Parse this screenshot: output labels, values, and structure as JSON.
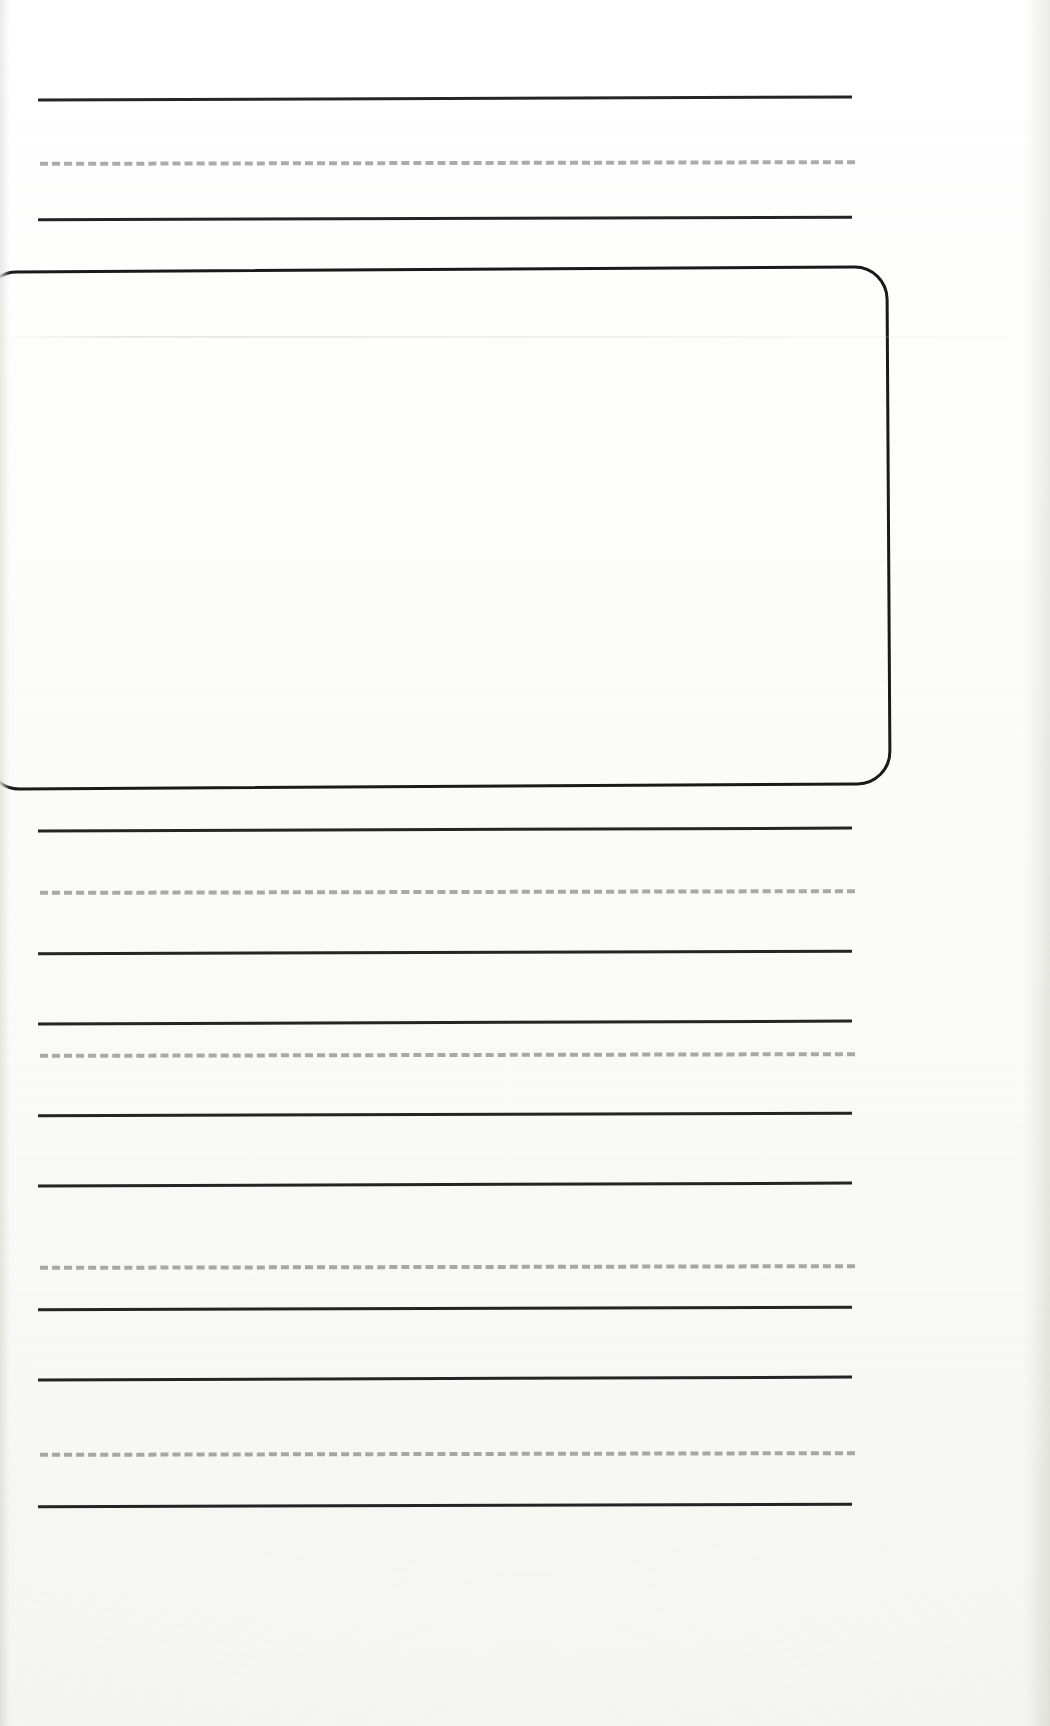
{
  "document": {
    "kind": "handwriting-practice-worksheet",
    "title": "",
    "page_width": 1050,
    "page_height": 1726,
    "background_color": "#ffffff",
    "visible_text": "",
    "notes": ""
  },
  "geometry": {
    "line_left": 38,
    "line_right": 852,
    "line_width": 814,
    "dashed_left": 40,
    "dashed_width": 815
  },
  "colors": {
    "solid_rule": "#141414",
    "dashed_rule": "#a8a8a8",
    "box_border": "#1a1a1a",
    "paper": "#ffffff",
    "scan_shadow": "#e7e7e3"
  },
  "rule_groups": [
    {
      "name": "group-top",
      "lines": [
        {
          "type": "solid",
          "y": 97,
          "left": 38,
          "width": 814,
          "rotate": -0.22
        },
        {
          "type": "dashed",
          "y": 161,
          "left": 40,
          "width": 815,
          "rotate": -0.12
        },
        {
          "type": "solid",
          "y": 217,
          "left": 38,
          "width": 814,
          "rotate": -0.18
        }
      ]
    },
    {
      "name": "group-2",
      "lines": [
        {
          "type": "solid",
          "y": 828,
          "left": 38,
          "width": 814,
          "rotate": -0.2
        },
        {
          "type": "dashed",
          "y": 890,
          "left": 40,
          "width": 815,
          "rotate": -0.12
        },
        {
          "type": "solid",
          "y": 951,
          "left": 38,
          "width": 814,
          "rotate": -0.18
        }
      ]
    },
    {
      "name": "group-3",
      "lines": [
        {
          "type": "solid",
          "y": 1021,
          "left": 38,
          "width": 814,
          "rotate": -0.2
        },
        {
          "type": "dashed",
          "y": 1053,
          "left": 40,
          "width": 815,
          "rotate": -0.12
        },
        {
          "type": "solid",
          "y": 1113,
          "left": 38,
          "width": 814,
          "rotate": -0.18
        }
      ]
    },
    {
      "name": "group-4",
      "lines": [
        {
          "type": "solid",
          "y": 1183,
          "left": 38,
          "width": 814,
          "rotate": -0.2
        },
        {
          "type": "dashed",
          "y": 1265,
          "left": 40,
          "width": 815,
          "rotate": -0.12
        },
        {
          "type": "solid",
          "y": 1307,
          "left": 38,
          "width": 814,
          "rotate": -0.18
        }
      ]
    },
    {
      "name": "group-5",
      "lines": [
        {
          "type": "solid",
          "y": 1377,
          "left": 38,
          "width": 814,
          "rotate": -0.2
        },
        {
          "type": "dashed",
          "y": 1452,
          "left": 40,
          "width": 815,
          "rotate": -0.12
        },
        {
          "type": "solid",
          "y": 1504,
          "left": 38,
          "width": 814,
          "rotate": -0.18
        }
      ]
    }
  ],
  "trace_box": {
    "name": "drawing-box",
    "left": -16,
    "top": 268,
    "width": 906,
    "height": 520,
    "radius": 34,
    "border_width": 3,
    "rotate": -0.35,
    "content": ""
  },
  "scan_artifacts": {
    "fold_y": 336,
    "fold_opacity": 0.7
  }
}
